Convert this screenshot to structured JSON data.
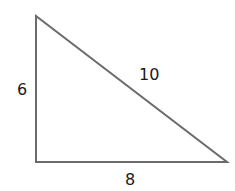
{
  "diagram": {
    "type": "right-triangle",
    "stroke_color": "#6b6b6b",
    "vertices": {
      "top": [
        36,
        16
      ],
      "bottom_left": [
        36,
        162
      ],
      "bottom_right": [
        227,
        162
      ]
    },
    "labels": {
      "left_side": "6",
      "hypotenuse": "10",
      "bottom_side": "8"
    }
  }
}
